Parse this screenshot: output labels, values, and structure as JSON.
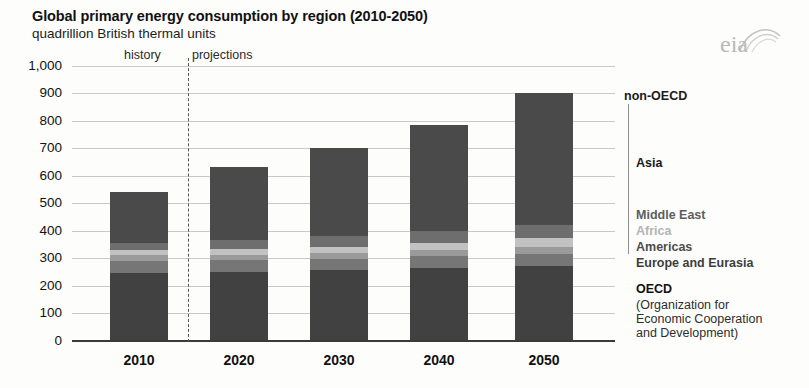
{
  "header": {
    "title": "Global primary energy consumption by region (2010-2050)",
    "subtitle": "quadrillion British thermal units",
    "logo_text": "eia",
    "logo_name": "eia-logo"
  },
  "annotations": {
    "history": "history",
    "projections": "projections"
  },
  "legend": {
    "group_non_oecd": "non-OECD",
    "group_oecd": "OECD",
    "oecd_expansion_line1": "(Organization for",
    "oecd_expansion_line2": "Economic Cooperation",
    "oecd_expansion_line3": "and Development)",
    "entries": [
      {
        "label": "Asia",
        "color": "#4a4a4a"
      },
      {
        "label": "Middle East",
        "color": "#6e6e6e"
      },
      {
        "label": "Africa",
        "color": "#c2c2c2"
      },
      {
        "label": "Americas",
        "color": "#9a9a9a"
      },
      {
        "label": "Europe and Eurasia",
        "color": "#767676"
      }
    ]
  },
  "chart_data": {
    "type": "bar",
    "title": "Global primary energy consumption by region (2010-2050)",
    "subtitle": "quadrillion British thermal units",
    "xlabel": "",
    "ylabel": "quadrillion British thermal units",
    "ylim": [
      0,
      1000
    ],
    "ytick_step": 100,
    "yticks": [
      "0",
      "100",
      "200",
      "300",
      "400",
      "500",
      "600",
      "700",
      "800",
      "900",
      "1,000"
    ],
    "grid": true,
    "stacked": true,
    "legend_position": "right",
    "categories": [
      "2010",
      "2020",
      "2030",
      "2040",
      "2050"
    ],
    "series": [
      {
        "name": "OECD",
        "color": "#414141",
        "values": [
          245,
          250,
          255,
          262,
          270
        ]
      },
      {
        "name": "Europe and Eurasia",
        "color": "#767676",
        "values": [
          45,
          42,
          42,
          43,
          45
        ]
      },
      {
        "name": "Americas",
        "color": "#9a9a9a",
        "values": [
          20,
          20,
          22,
          24,
          26
        ]
      },
      {
        "name": "Africa",
        "color": "#c2c2c2",
        "values": [
          18,
          20,
          22,
          26,
          30
        ]
      },
      {
        "name": "Middle East",
        "color": "#6e6e6e",
        "values": [
          27,
          33,
          37,
          42,
          48
        ]
      },
      {
        "name": "Asia",
        "color": "#4a4a4a",
        "values": [
          185,
          265,
          322,
          388,
          481
        ]
      }
    ],
    "totals": [
      540,
      630,
      700,
      785,
      900
    ],
    "annotations": [
      {
        "text": "history",
        "x": "left of 2015 divider"
      },
      {
        "text": "projections",
        "x": "right of 2015 divider"
      }
    ],
    "divider": {
      "type": "dashed-vertical",
      "between": [
        "2010",
        "2020"
      ],
      "label": "history / projections"
    }
  }
}
